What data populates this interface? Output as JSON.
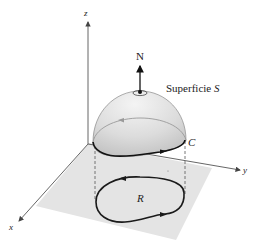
{
  "figure": {
    "type": "3d-surface-diagram"
  },
  "labels": {
    "z_axis": "z",
    "y_axis": "y",
    "x_axis": "x",
    "normal": "N",
    "surface": "Superficie S",
    "curve": "C",
    "region": "R"
  },
  "colors": {
    "plane_fill": "#e2e2e2",
    "dome_fill": "#d6d6d6",
    "curve_stroke": "#1a1a1a",
    "axis_stroke": "#555555"
  }
}
